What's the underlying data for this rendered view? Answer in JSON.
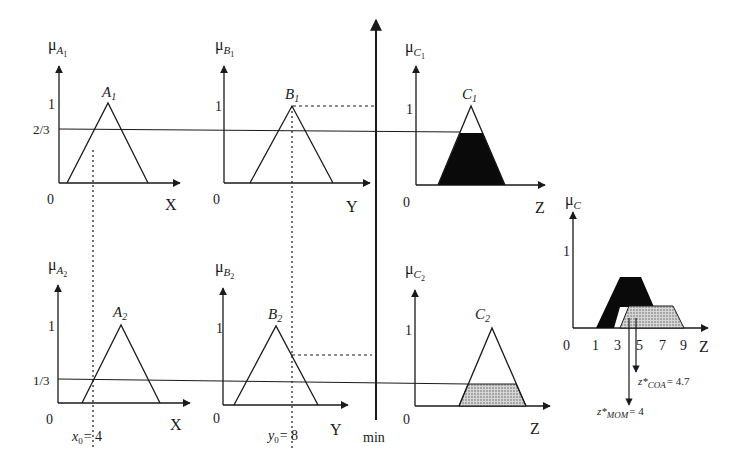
{
  "colors": {
    "ink": "#1a1a1a",
    "fill_dark": "#0a0a0a",
    "fill_dotted": "#bdbdbd"
  },
  "rules": [
    {
      "antecedents": [
        {
          "axis_var": "X",
          "mu_label": "μ",
          "mu_sub": "A",
          "mu_subsub": "1",
          "set_label": "A",
          "set_sub": "1",
          "origin": "0",
          "one": "1",
          "level_label": "2/3",
          "degree": 0.6667
        },
        {
          "axis_var": "Y",
          "mu_label": "μ",
          "mu_sub": "B",
          "mu_subsub": "1",
          "set_label": "B",
          "set_sub": "1",
          "origin": "0",
          "one": "1",
          "degree": 1.0
        }
      ],
      "consequent": {
        "axis_var": "Z",
        "mu_label": "μ",
        "mu_sub": "C",
        "mu_subsub": "1",
        "set_label": "C",
        "set_sub": "1",
        "origin": "0",
        "one": "1",
        "clip_level": 0.6667,
        "fill": "solid"
      }
    },
    {
      "antecedents": [
        {
          "axis_var": "X",
          "mu_label": "μ",
          "mu_sub": "A",
          "mu_subsub": "2",
          "set_label": "A",
          "set_sub": "2",
          "origin": "0",
          "one": "1",
          "level_label": "1/3",
          "degree": 0.3333
        },
        {
          "axis_var": "Y",
          "mu_label": "μ",
          "mu_sub": "B",
          "mu_subsub": "2",
          "set_label": "B",
          "set_sub": "2",
          "origin": "0",
          "one": "1",
          "degree": 0.6
        }
      ],
      "consequent": {
        "axis_var": "Z",
        "mu_label": "μ",
        "mu_sub": "C",
        "mu_subsub": "2",
        "set_label": "C",
        "set_sub": "2",
        "origin": "0",
        "one": "1",
        "clip_level": 0.3333,
        "fill": "dotted"
      }
    }
  ],
  "inputs": {
    "x0": {
      "var": "x",
      "sub": "0",
      "eq": "= 4",
      "value": 4
    },
    "y0": {
      "var": "y",
      "sub": "0",
      "eq": "= 8",
      "value": 8
    }
  },
  "operator_label": "min",
  "aggregate": {
    "mu_label": "μ",
    "mu_sub": "C",
    "one": "1",
    "axis_var": "Z",
    "ticks": [
      "0",
      "1",
      "3",
      "5",
      "7",
      "9"
    ],
    "coa": {
      "z": "z*",
      "sub": "COA",
      "eq": "= 4.7",
      "value": 4.7
    },
    "mom": {
      "z": "z*",
      "sub": "MOM",
      "eq": "= 4",
      "value": 4
    }
  }
}
